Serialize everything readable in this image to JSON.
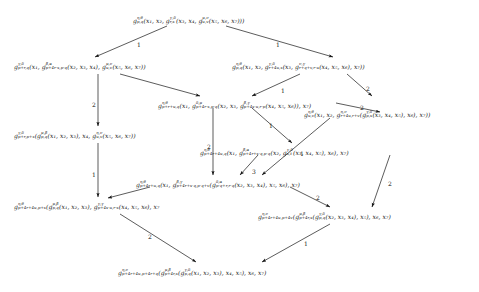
{
  "figure": {
    "kind": "commutative-diagram",
    "background_color": "#ffffff",
    "text_color": "#161616",
    "width": 479,
    "height": 292
  },
  "nodes": [
    {
      "id": "n1",
      "name": "node-top",
      "x": 133,
      "y": 16,
      "text": "g^{η,θ}_{p,q}(x₁, x₂, g^{γ,δ}_{r,s}(x₃, x₄, g^{μ,ν}_{u,v}(x₅, x₆, x₇)))",
      "parts": [
        {
          "g": "g",
          "sup": "η,θ",
          "sub": "p,q",
          "tail": "(x"
        },
        {
          "lit": "₁, x₂, "
        },
        {
          "g": "g",
          "sup": "γ,δ",
          "sub": "r,s",
          "tail": "(x"
        },
        {
          "lit": "₃, x₄, "
        },
        {
          "g": "g",
          "sup": "μ,ν",
          "sub": "u,v",
          "tail": "(x"
        },
        {
          "lit": "₅, x₆, x₇)))"
        }
      ]
    },
    {
      "id": "n2",
      "name": "node-left-upper",
      "x": 14,
      "y": 62,
      "parts": [
        {
          "g": "g",
          "sup": "γ,δ",
          "sub": "p+r,q",
          "tail": "(x"
        },
        {
          "lit": "₁, "
        },
        {
          "g": "g",
          "sup": "β,α",
          "sub": "p+4r-s,p-q",
          "tail": "(x"
        },
        {
          "lit": "₂, x₃, x₄), "
        },
        {
          "g": "g",
          "sup": "μ,ν",
          "sub": "u,v",
          "tail": "(x"
        },
        {
          "lit": "₅, x₆, x₇))"
        }
      ]
    },
    {
      "id": "n3",
      "name": "node-right-upper",
      "x": 232,
      "y": 62,
      "parts": [
        {
          "g": "g",
          "sup": "η,θ",
          "sub": "p,q",
          "tail": "(x"
        },
        {
          "lit": "₁, x₂, "
        },
        {
          "g": "g",
          "sup": "γ,δ",
          "sub": "r+4u,s",
          "tail": "(x"
        },
        {
          "lit": "₃, "
        },
        {
          "g": "g",
          "sup": "ν,γ",
          "sub": "r+q+v,r-u",
          "tail": "(x"
        },
        {
          "lit": "₄, x₅, x₆), x₇))"
        }
      ]
    },
    {
      "id": "n4",
      "name": "node-center-upper",
      "x": 158,
      "y": 101,
      "parts": [
        {
          "g": "g",
          "sup": "η,θ",
          "sub": "p+r+u,q",
          "tail": "(x"
        },
        {
          "lit": "₁, "
        },
        {
          "g": "g",
          "sup": "δ,μ",
          "sub": "p+4r-s,p-q",
          "tail": "(x"
        },
        {
          "lit": "₂, x₃, "
        },
        {
          "g": "g",
          "sup": "β,γ",
          "sub": "p+4s-u,r-p",
          "tail": "(x"
        },
        {
          "lit": "₄, x₅, x₆)), x₇)"
        }
      ]
    },
    {
      "id": "n5",
      "name": "node-right-mid-upper",
      "x": 304,
      "y": 110,
      "parts": [
        {
          "g": "g",
          "sup": "η,θ",
          "sub": "u,v",
          "tail": "(x"
        },
        {
          "lit": "₁, x₂, "
        },
        {
          "g": "g",
          "sup": "η,ν",
          "sub": "r+4u,r+v",
          "tail": "("
        },
        {
          "g": "g",
          "sup": "γ,δ",
          "sub": "p,s",
          "tail": "(x"
        },
        {
          "lit": "₃, x₄, x₅), x₆), x₇))"
        }
      ]
    },
    {
      "id": "n6",
      "name": "node-left-mid",
      "x": 14,
      "y": 131,
      "parts": [
        {
          "g": "g",
          "sup": "γ,δ",
          "sub": "p+r,p+s",
          "tail": "("
        },
        {
          "g": "g",
          "sup": "μ,β",
          "sub": "p,q",
          "tail": "(x"
        },
        {
          "lit": "₁, x₂, x₃), x₄, "
        },
        {
          "g": "g",
          "sup": "η,ν",
          "sub": "u,v",
          "tail": "(x"
        },
        {
          "lit": "₅, x₆, x₇))"
        }
      ]
    },
    {
      "id": "n7",
      "name": "node-center-mid",
      "x": 200,
      "y": 148,
      "parts": [
        {
          "g": "g",
          "sup": "η,θ",
          "sub": "p+4r+4u,q",
          "tail": "(x"
        },
        {
          "lit": "₁, "
        },
        {
          "g": "g",
          "sup": "β,α",
          "sub": "p+4r+s-q,p-q",
          "tail": "(x"
        },
        {
          "lit": "₂, "
        },
        {
          "g": "g",
          "sup": "γ,δ",
          "sub": "s,t",
          "tail": "(x"
        },
        {
          "lit": "₃, x₄, x₅), x₆), x₇)"
        }
      ]
    },
    {
      "id": "n8",
      "name": "node-center-lower",
      "x": 136,
      "y": 180,
      "parts": [
        {
          "g": "g",
          "sup": "η,θ",
          "sub": "p+4r+u,q",
          "tail": "(x"
        },
        {
          "lit": "₁, "
        },
        {
          "g": "g",
          "sup": "β,γ",
          "sub": "p+4r+s-q,p-q+v",
          "tail": "("
        },
        {
          "g": "g",
          "sup": "δ,α",
          "sub": "p-q+r,r-q",
          "tail": "(x"
        },
        {
          "lit": "₂, x₃, x₄), x₅, x₆), x₇)"
        }
      ]
    },
    {
      "id": "n9",
      "name": "node-left-lower",
      "x": 14,
      "y": 202,
      "parts": [
        {
          "g": "g",
          "sup": "η,θ",
          "sub": "p+4r+4u,p+s",
          "tail": "("
        },
        {
          "g": "g",
          "sup": "μ,β",
          "sub": "p,q",
          "tail": "(x"
        },
        {
          "lit": "₁, x₂, x₃), "
        },
        {
          "g": "g",
          "sup": "γ,γ",
          "sub": "p+4s-u,r-s",
          "tail": "(x"
        },
        {
          "lit": "₄, x₅, x₆), x₇"
        }
      ]
    },
    {
      "id": "n10",
      "name": "node-right-lower",
      "x": 258,
      "y": 212,
      "parts": [
        {
          "g": "g",
          "sup": "η,ν",
          "sub": "p+4r+4u,p+4v",
          "tail": "("
        },
        {
          "g": "g",
          "sup": "μ,β",
          "sub": "p+4r,s",
          "tail": "("
        },
        {
          "g": "g",
          "sup": "γ,δ",
          "sub": "p,q",
          "tail": "(x"
        },
        {
          "lit": "₂, x₃, x₄), x₅), x₆, x₇)"
        }
      ]
    },
    {
      "id": "n11",
      "name": "node-bottom",
      "x": 118,
      "y": 268,
      "parts": [
        {
          "g": "g",
          "sup": "η,ν",
          "sub": "p+4r+4u,p+4r+q",
          "tail": "("
        },
        {
          "g": "g",
          "sup": "μ,β",
          "sub": "p+4r,s",
          "tail": "("
        },
        {
          "g": "g",
          "sup": "γ,δ",
          "sub": "p,q",
          "tail": "(x"
        },
        {
          "lit": "₁, x₂, x₃), x₄, x₅), x₆, x₇)"
        }
      ]
    }
  ],
  "edges": [
    {
      "name": "edge-top-to-left-upper",
      "from": "n1",
      "to": "n2",
      "x1": 167,
      "y1": 26,
      "x2": 95,
      "y2": 57,
      "label": "1",
      "lx": 137,
      "ly": 41
    },
    {
      "name": "edge-top-to-right-upper",
      "from": "n1",
      "to": "n3",
      "x1": 226,
      "y1": 26,
      "x2": 333,
      "y2": 57,
      "label": "1",
      "lx": 276,
      "ly": 41
    },
    {
      "name": "edge-left-upper-to-left-mid",
      "from": "n2",
      "to": "n6",
      "x1": 98,
      "y1": 74,
      "x2": 98,
      "y2": 126,
      "label": "2",
      "lx": 92,
      "ly": 101
    },
    {
      "name": "edge-left-upper-to-center-up",
      "from": "n2",
      "to": "n4",
      "x1": 120,
      "y1": 74,
      "x2": 200,
      "y2": 96,
      "label": "",
      "lx": 0,
      "ly": 0
    },
    {
      "name": "edge-right-upper-to-center-up",
      "from": "n3",
      "to": "n4",
      "x1": 300,
      "y1": 74,
      "x2": 252,
      "y2": 96,
      "label": "1",
      "lx": 281,
      "ly": 87
    },
    {
      "name": "edge-right-upper-to-right-mid",
      "from": "n3",
      "to": "n5",
      "x1": 347,
      "y1": 74,
      "x2": 372,
      "y2": 96,
      "label": "2",
      "lx": 366,
      "ly": 85
    },
    {
      "name": "edge-center-up-to-right-mid",
      "from": "n4",
      "to": "n5",
      "x1": 336,
      "y1": 103,
      "x2": 380,
      "y2": 112,
      "label": "2",
      "lx": 360,
      "ly": 104
    },
    {
      "name": "edge-center-up-to-center-mid",
      "from": "n4",
      "to": "n7",
      "x1": 252,
      "y1": 108,
      "x2": 292,
      "y2": 143,
      "label": "1",
      "lx": 269,
      "ly": 122
    },
    {
      "name": "edge-left-mid-to-left-lower",
      "from": "n6",
      "to": "n9",
      "x1": 98,
      "y1": 143,
      "x2": 98,
      "y2": 197,
      "label": "1",
      "lx": 92,
      "ly": 171
    },
    {
      "name": "edge-center-up-to-center-low",
      "from": "n4",
      "to": "n8",
      "x1": 213,
      "y1": 108,
      "x2": 213,
      "y2": 175,
      "label": "2",
      "lx": 207,
      "ly": 143
    },
    {
      "name": "edge-center-mid-to-center-low",
      "from": "n7",
      "to": "n8",
      "x1": 258,
      "y1": 155,
      "x2": 240,
      "y2": 175,
      "label": "3",
      "lx": 252,
      "ly": 168
    },
    {
      "name": "edge-right-mid-to-center-low",
      "from": "n5",
      "to": "n8",
      "x1": 330,
      "y1": 118,
      "x2": 262,
      "y2": 175,
      "label": "1",
      "lx": 300,
      "ly": 150
    },
    {
      "name": "edge-center-low-to-left-lower",
      "from": "n8",
      "to": "n9",
      "x1": 150,
      "y1": 187,
      "x2": 108,
      "y2": 198,
      "label": "",
      "lx": 0,
      "ly": 0
    },
    {
      "name": "edge-center-low-to-right-low",
      "from": "n8",
      "to": "n10",
      "x1": 290,
      "y1": 187,
      "x2": 330,
      "y2": 207,
      "label": "2",
      "lx": 316,
      "ly": 194
    },
    {
      "name": "edge-center-mid-to-right-low",
      "from": "n7",
      "to": "n10",
      "x1": 390,
      "y1": 155,
      "x2": 372,
      "y2": 207,
      "label": "2",
      "lx": 388,
      "ly": 180
    },
    {
      "name": "edge-left-lower-to-bottom",
      "from": "n9",
      "to": "n11",
      "x1": 120,
      "y1": 214,
      "x2": 196,
      "y2": 262,
      "label": "2",
      "lx": 148,
      "ly": 233
    },
    {
      "name": "edge-right-low-to-bottom",
      "from": "n10",
      "to": "n11",
      "x1": 330,
      "y1": 224,
      "x2": 262,
      "y2": 262,
      "label": "1",
      "lx": 304,
      "ly": 240
    }
  ],
  "edge_labels": [
    "1",
    "1",
    "2",
    "1",
    "2",
    "2",
    "1",
    "1",
    "2",
    "3",
    "1",
    "2",
    "2",
    "2",
    "1"
  ]
}
